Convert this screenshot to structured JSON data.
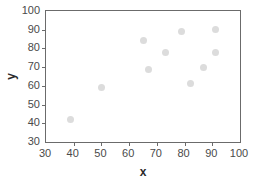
{
  "chart_data": {
    "type": "scatter",
    "title": "",
    "xlabel": "x",
    "ylabel": "y",
    "xlim": [
      30,
      100
    ],
    "ylim": [
      30,
      100
    ],
    "xticks": [
      30,
      40,
      50,
      60,
      70,
      80,
      90,
      100
    ],
    "yticks": [
      30,
      40,
      50,
      60,
      70,
      80,
      90,
      100
    ],
    "grid": false,
    "legend": null,
    "marker_color": "#dcdcdc",
    "axis_color": "#6b6b6b",
    "points": [
      {
        "x": 39,
        "y": 42
      },
      {
        "x": 50,
        "y": 59
      },
      {
        "x": 65,
        "y": 84
      },
      {
        "x": 67,
        "y": 69
      },
      {
        "x": 73,
        "y": 78
      },
      {
        "x": 79,
        "y": 89
      },
      {
        "x": 82,
        "y": 61
      },
      {
        "x": 87,
        "y": 70
      },
      {
        "x": 91,
        "y": 78
      },
      {
        "x": 91,
        "y": 90
      }
    ],
    "series": [
      {
        "name": "",
        "x": [
          39,
          50,
          65,
          67,
          73,
          79,
          82,
          87,
          91,
          91
        ],
        "values": [
          42,
          59,
          84,
          69,
          78,
          89,
          61,
          70,
          78,
          90
        ]
      }
    ]
  }
}
